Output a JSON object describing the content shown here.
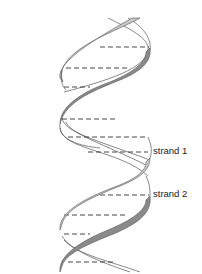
{
  "diagram": {
    "type": "dna-double-helix",
    "labels": [
      {
        "id": "strand1",
        "text": "strand 1"
      },
      {
        "id": "strand2",
        "text": "strand 2"
      }
    ],
    "colors": {
      "background": "#ffffff",
      "strand_light": "#c8c8c8",
      "strand_dark": "#8a8a8a",
      "outline": "#555555",
      "base_pair_dash": "#333333",
      "label_text": "#222222"
    },
    "base_pair_count": 12
  }
}
